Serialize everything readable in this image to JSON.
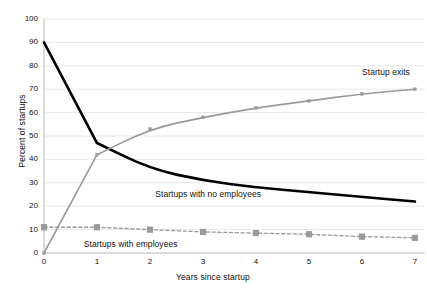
{
  "chart_data": {
    "type": "line",
    "title": "",
    "xlabel": "Years since startup",
    "ylabel": "Percent of startups",
    "x": [
      0,
      1,
      2,
      3,
      4,
      5,
      6,
      7
    ],
    "xlim": [
      0,
      7
    ],
    "ylim": [
      0,
      100
    ],
    "xticks": [
      "0",
      "1",
      "2",
      "3",
      "4",
      "5",
      "6",
      "7"
    ],
    "yticks": [
      "0",
      "10",
      "20",
      "30",
      "40",
      "50",
      "60",
      "70",
      "80",
      "90",
      "100"
    ],
    "grid": "horizontal",
    "legend": "inline-annotations",
    "series": [
      {
        "name": "Startups with no employees",
        "values": [
          90,
          47,
          36,
          31,
          28,
          26,
          24,
          22
        ],
        "color": "#000000",
        "style": "solid",
        "width": 2.6,
        "marker": "none"
      },
      {
        "name": "Startup exits",
        "values": [
          0,
          42,
          53,
          58,
          62,
          65,
          68,
          70
        ],
        "color": "#9a9a9a",
        "style": "solid",
        "width": 1.6,
        "marker": "small-diamond"
      },
      {
        "name": "Startups with employees",
        "values": [
          11,
          11,
          10,
          9,
          8.5,
          8,
          7,
          6.5
        ],
        "color": "#9a9a9a",
        "style": "dashed",
        "width": 1.3,
        "marker": "square"
      }
    ],
    "annotations": [
      {
        "text": "Startup exits",
        "x": 6.0,
        "y": 77
      },
      {
        "text": "Startups with no employees",
        "x": 2.1,
        "y": 25
      },
      {
        "text": "Startups with employees",
        "x": 0.75,
        "y": 3.5
      }
    ]
  },
  "colors": {
    "no_employees": "#000000",
    "exits": "#9a9a9a",
    "with_employees": "#9a9a9a",
    "grid": "#e8e8e8",
    "axis": "#b9b9b9",
    "text": "#111111",
    "background": "#ffffff"
  }
}
